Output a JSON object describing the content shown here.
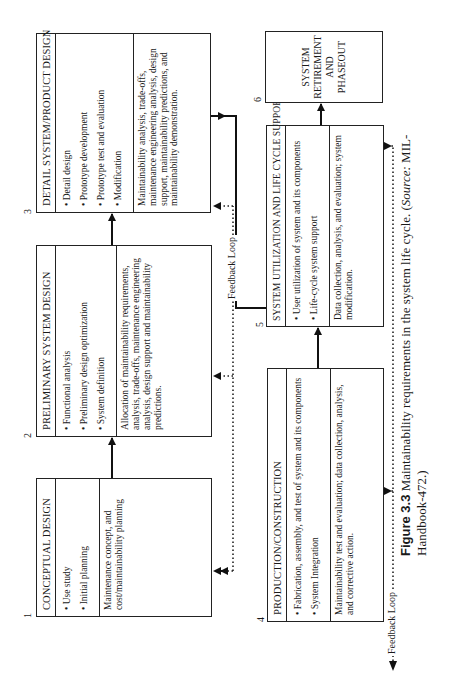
{
  "boxes": {
    "b1": {
      "number": "1",
      "title": "CONCEPTUAL DESIGN",
      "items": [
        "• Use study",
        "• Initial planning"
      ],
      "description": "Maintenance concept, and cost/maintainability planning"
    },
    "b2": {
      "number": "2",
      "title": "PRELIMINARY SYSTEM DESIGN",
      "items": [
        "• Functional analysis",
        "• Preliminary design optimization",
        "• System definition"
      ],
      "description": "Allocation of maintainability requirements, analysis, trade-offs, maintenance engineering analysis, design support and maintainability predictions."
    },
    "b3": {
      "number": "3",
      "title": "DETAIL SYSTEM/PRODUCT DESIGN",
      "items": [
        "• Detail design",
        "• Prototype development",
        "• Prototype test and evaluation",
        "• Modification"
      ],
      "description": "Maintainability analysis, trade-offs, maintenance engineering analysis, design support, maintainability predictions, and maintainability demonstration."
    },
    "b4": {
      "number": "4",
      "title": "PRODUCTION/CONSTRUCTION",
      "items": [
        "• Fabrication, assembly, and test of system and its components",
        "• System Integration"
      ],
      "description": "Maintainability test and evaluation; data collection, analysis, and corrective action."
    },
    "b5": {
      "number": "5",
      "title": "SYSTEM UTILIZATION AND LIFE CYCLE SUPPORT",
      "items": [
        "• User utilization of system and its components",
        "• Life-cycle system support"
      ],
      "description": "Data collection, analysis, and evaluation; system modification."
    },
    "b6": {
      "number": "6",
      "lines": [
        "SYSTEM",
        "RETIREMENT",
        "AND",
        "PHASEOUT"
      ]
    }
  },
  "feedback": {
    "upper_label": "Feedback Loop",
    "lower_label": "Feedback Loop"
  },
  "caption": {
    "figure_label": "Figure 3.3",
    "text": " Maintainability requirements in the system life cycle. (",
    "source_label": "Source:",
    "source_text": " MIL-Handbook-472.)"
  }
}
